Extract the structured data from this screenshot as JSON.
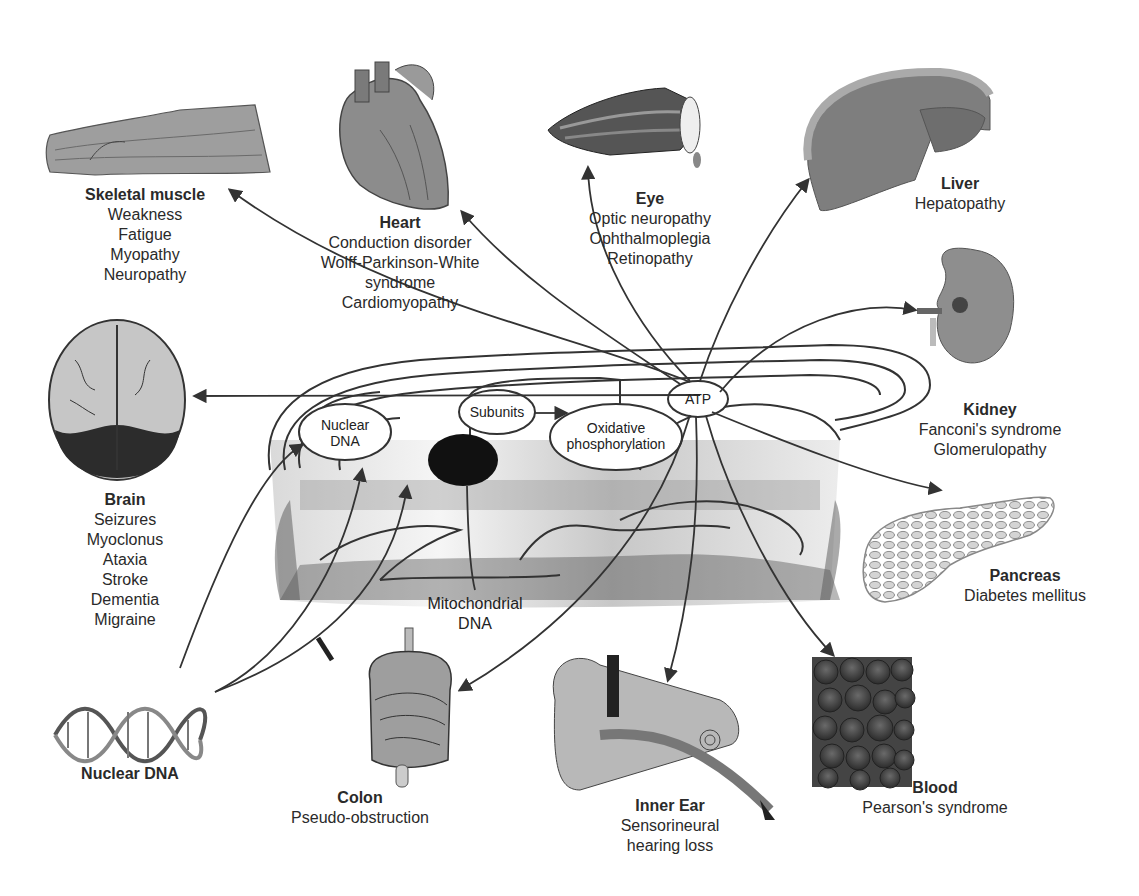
{
  "diagram": {
    "central": {
      "nodes": {
        "nuclear_dna": "Nuclear DNA",
        "subunits": "Subunits",
        "oxphos_line1": "Oxidative",
        "oxphos_line2": "phosphorylation",
        "atp": "ATP",
        "mito_dna_line1": "Mitochondrial",
        "mito_dna_line2": "DNA"
      }
    },
    "organs": [
      {
        "id": "skeletal-muscle",
        "title": "Skeletal muscle",
        "symptoms": [
          "Weakness",
          "Fatigue",
          "Myopathy",
          "Neuropathy"
        ]
      },
      {
        "id": "heart",
        "title": "Heart",
        "symptoms": [
          "Conduction disorder",
          "Wolff-Parkinson-White",
          "syndrome",
          "Cardiomyopathy"
        ]
      },
      {
        "id": "eye",
        "title": "Eye",
        "symptoms": [
          "Optic neuropathy",
          "Ophthalmoplegia",
          "Retinopathy"
        ]
      },
      {
        "id": "liver",
        "title": "Liver",
        "symptoms": [
          "Hepatopathy"
        ]
      },
      {
        "id": "kidney",
        "title": "Kidney",
        "symptoms": [
          "Fanconi's syndrome",
          "Glomerulopathy"
        ]
      },
      {
        "id": "brain",
        "title": "Brain",
        "symptoms": [
          "Seizures",
          "Myoclonus",
          "Ataxia",
          "Stroke",
          "Dementia",
          "Migraine"
        ]
      },
      {
        "id": "pancreas",
        "title": "Pancreas",
        "symptoms": [
          "Diabetes mellitus"
        ]
      },
      {
        "id": "nuclear-dna",
        "title": "Nuclear DNA",
        "symptoms": []
      },
      {
        "id": "colon",
        "title": "Colon",
        "symptoms": [
          "Pseudo-obstruction"
        ]
      },
      {
        "id": "inner-ear",
        "title": "Inner Ear",
        "symptoms": [
          "Sensorineural",
          "hearing loss"
        ]
      },
      {
        "id": "blood",
        "title": "Blood",
        "symptoms": [
          "Pearson's syndrome"
        ]
      }
    ],
    "colors": {
      "line": "#333333",
      "organ_fill": "#8a8a8a",
      "organ_dark": "#4a4a4a",
      "organ_light": "#c8c8c8",
      "node_fill": "#ffffff",
      "mito_dark_blob": "#1a1a1a"
    }
  }
}
